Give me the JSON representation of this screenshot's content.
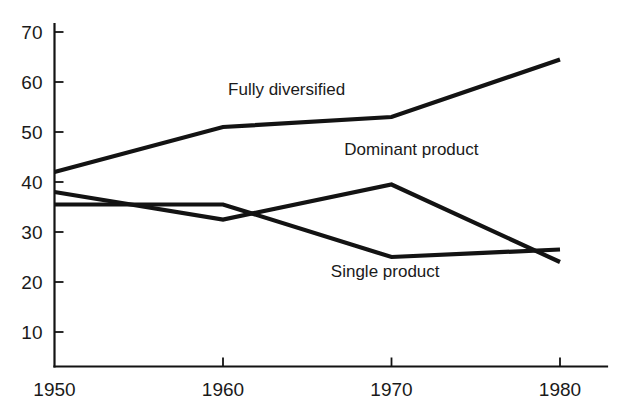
{
  "chart_data": {
    "type": "line",
    "title": "",
    "subtitle": "",
    "xlabel": "",
    "ylabel": "",
    "x": [
      1950,
      1960,
      1970,
      1980
    ],
    "xtick_labels": [
      "1950",
      "1960",
      "1970",
      "1980"
    ],
    "ytick_labels": [
      "10",
      "20",
      "30",
      "40",
      "50",
      "60",
      "70"
    ],
    "yticks": [
      10,
      20,
      30,
      40,
      50,
      60,
      70
    ],
    "xlim": [
      1950,
      1981
    ],
    "ylim": [
      0,
      73
    ],
    "grid": false,
    "legend": "inline-annotations",
    "series": [
      {
        "name": "Fully diversified",
        "values": [
          42,
          51,
          53,
          64.5
        ],
        "label_text": "Fully diversified",
        "label_x": 1960.3,
        "label_y": 57.5,
        "color": "#131313"
      },
      {
        "name": "Dominant product",
        "values": [
          38,
          32.5,
          39.5,
          24
        ],
        "label_text": "Dominant product",
        "label_x": 1967.2,
        "label_y": 45.5,
        "color": "#131313"
      },
      {
        "name": "Single product",
        "values": [
          35.5,
          35.5,
          25,
          26.5
        ],
        "label_text": "Single product",
        "label_x": 1966.4,
        "label_y": 21.0,
        "color": "#131313"
      }
    ],
    "annotations": [
      "Fully diversified",
      "Dominant product",
      "Single product"
    ]
  },
  "axes": {
    "tick_mark_length": 9,
    "axis_color": "#131313"
  }
}
